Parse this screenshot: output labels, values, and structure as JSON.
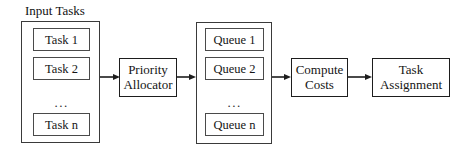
{
  "diagram": {
    "type": "flowchart",
    "orientation": "left-to-right",
    "background_color": "#ffffff",
    "line_color": "#1d1d1d",
    "text_color": "#111111"
  },
  "input_group": {
    "caption": "Input Tasks",
    "items": [
      {
        "label": "Task 1"
      },
      {
        "label": "Task 2"
      },
      {
        "label": "Task n"
      }
    ],
    "ellipsis": "..."
  },
  "priority_allocator": {
    "line1": "Priority",
    "line2": "Allocator"
  },
  "queue_group": {
    "caption": "",
    "items": [
      {
        "label": "Queue 1"
      },
      {
        "label": "Queue 2"
      },
      {
        "label": "Queue n"
      }
    ],
    "ellipsis": "..."
  },
  "compute_costs": {
    "line1": "Compute",
    "line2": "Costs"
  },
  "task_assignment": {
    "line1": "Task",
    "line2": "Assignment"
  },
  "arrows": [
    {
      "name": "input-to-allocator",
      "from": "input_group",
      "to": "priority_allocator"
    },
    {
      "name": "allocator-to-queues",
      "from": "priority_allocator",
      "to": "queue_group"
    },
    {
      "name": "queues-to-compute",
      "from": "queue_group",
      "to": "compute_costs"
    },
    {
      "name": "compute-to-assignment",
      "from": "compute_costs",
      "to": "task_assignment"
    }
  ]
}
